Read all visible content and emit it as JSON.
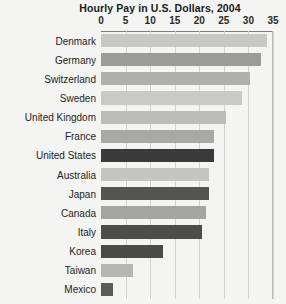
{
  "chart_data": {
    "type": "bar",
    "orientation": "horizontal",
    "title": "Hourly Pay in U.S. Dollars, 2004",
    "xlabel": "",
    "ylabel": "",
    "xlim": [
      0,
      35
    ],
    "tick_labels": [
      "0",
      "5",
      "10",
      "15",
      "20",
      "25",
      "30",
      "35"
    ],
    "tick_values": [
      0,
      5,
      10,
      15,
      20,
      25,
      30,
      35
    ],
    "grid": true,
    "legend": "none",
    "categories": [
      "Denmark",
      "Germany",
      "Switzerland",
      "Sweden",
      "United Kingdom",
      "France",
      "United States",
      "Australia",
      "Japan",
      "Canada",
      "Italy",
      "Korea",
      "Taiwan",
      "Mexico"
    ],
    "values": [
      33.7,
      32.5,
      30.3,
      28.6,
      25.5,
      23.0,
      22.9,
      22.0,
      21.9,
      21.4,
      20.5,
      12.6,
      6.6,
      2.5
    ],
    "bar_colors": [
      "#c8c8c6",
      "#9b9b99",
      "#b0b0ae",
      "#c8c8c6",
      "#bcbcba",
      "#a8a8a6",
      "#3a3a3a",
      "#c4c4c2",
      "#545452",
      "#a4a4a2",
      "#4c4c4a",
      "#4a4a48",
      "#b6b6b4",
      "#5a5a58"
    ],
    "highlight_color": "#3a3a3a",
    "background_color": "#f4f4f2",
    "grid_color": "#d2d2d0"
  }
}
